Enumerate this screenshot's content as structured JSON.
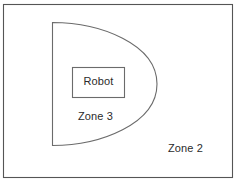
{
  "diagram": {
    "background_color": "#ffffff",
    "stroke_color": "#5a5a5a",
    "text_color": "#2b2b2b",
    "outer_frame": {
      "name": "outer-boundary",
      "x": 3,
      "y": 4,
      "width": 230,
      "height": 174
    },
    "shapes": [
      {
        "name": "zone-3-region",
        "type": "d-shape",
        "flat_edge_x": 52,
        "top_y": 22,
        "bottom_y": 146,
        "max_right_x": 157
      },
      {
        "name": "robot-box",
        "type": "rectangle",
        "x": 72,
        "y": 67,
        "width": 53,
        "height": 31
      }
    ],
    "labels": {
      "robot": "Robot",
      "zone3": "Zone 3",
      "zone2": "Zone 2"
    }
  }
}
